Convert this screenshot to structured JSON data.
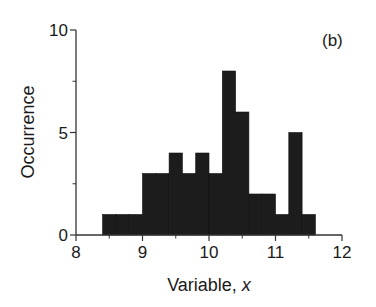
{
  "chart_data": {
    "type": "bar",
    "subtype": "histogram",
    "panel_label": "(b)",
    "title": "",
    "xlabel": "Variable, x",
    "xlabel_prefix": "Variable, ",
    "xlabel_var": "x",
    "ylabel": "Occurrence",
    "xlim": [
      8,
      12
    ],
    "ylim": [
      0,
      10
    ],
    "x_ticks_major": [
      8,
      9,
      10,
      11,
      12
    ],
    "x_ticks_minor": [
      8.5,
      9.5,
      10.5,
      11.5
    ],
    "y_ticks_major": [
      0,
      5,
      10
    ],
    "y_ticks_minor": [
      2.5,
      7.5
    ],
    "grid": false,
    "legend": null,
    "bin_width": 0.2,
    "bin_edges": [
      8.4,
      8.6,
      8.8,
      9.0,
      9.2,
      9.4,
      9.6,
      9.8,
      10.0,
      10.2,
      10.4,
      10.6,
      10.8,
      11.0,
      11.2,
      11.4,
      11.6
    ],
    "categories": [
      "8.4-8.6",
      "8.6-8.8",
      "8.8-9.0",
      "9.0-9.2",
      "9.2-9.4",
      "9.4-9.6",
      "9.6-9.8",
      "9.8-10.0",
      "10.0-10.2",
      "10.2-10.4",
      "10.4-10.6",
      "10.6-10.8",
      "10.8-11.0",
      "11.0-11.2",
      "11.2-11.4",
      "11.4-11.6"
    ],
    "values": [
      1,
      1,
      1,
      3,
      3,
      4,
      3,
      4,
      3,
      8,
      6,
      2,
      2,
      1,
      5,
      1
    ],
    "bar_color": "#1c1c1c",
    "axis_color": "#333333"
  }
}
